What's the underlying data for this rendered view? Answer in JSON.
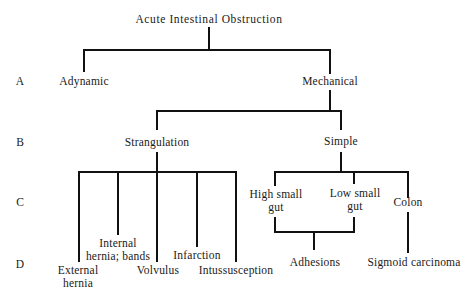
{
  "title": "Acute Intestinal Obstruction",
  "row_labels": [
    "A",
    "B",
    "C",
    "D"
  ],
  "nodes": {
    "adynamic": "Adynamic",
    "mechanical": "Mechanical",
    "strangulation": "Strangulation",
    "simple": "Simple",
    "high_small_gut": [
      "High small",
      "gut"
    ],
    "low_small_gut": [
      "Low small",
      "gut"
    ],
    "colon": "Colon",
    "internal_hernia": [
      "Internal",
      "hernia; bands"
    ],
    "infarction": "Infarction",
    "external_hernia": [
      "External",
      "hernia"
    ],
    "volvulus": "Volvulus",
    "intussusception": "Intussusception",
    "adhesions": "Adhesions",
    "sigmoid_carcinoma": "Sigmoid carcinoma"
  },
  "colors": {
    "line": "#111111",
    "text": "#1a1a1a",
    "background": "#ffffff"
  }
}
